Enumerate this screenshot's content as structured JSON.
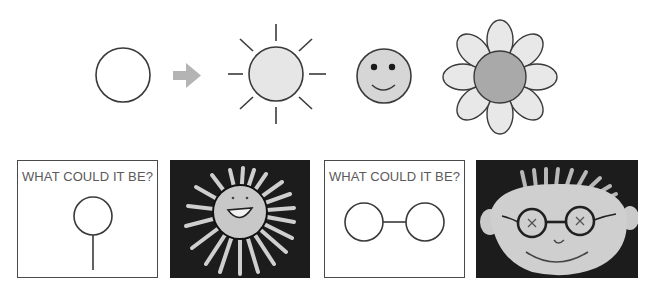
{
  "top_row": {
    "sequence": [
      {
        "id": "plain-circle",
        "label": "circle"
      },
      {
        "id": "arrow",
        "label": "arrow"
      },
      {
        "id": "sun",
        "label": "sun"
      },
      {
        "id": "smiley",
        "label": "smiley face"
      },
      {
        "id": "flower",
        "label": "flower"
      }
    ],
    "colors": {
      "stroke": "#3a3a3a",
      "arrow": "#b4b4b4",
      "sun_fill": "#e6e6e6",
      "smiley_fill": "#d6d6d6",
      "petal_fill": "#e8e8e8",
      "flower_center_fill": "#a9a9a9"
    }
  },
  "bottom_row": {
    "panels": [
      {
        "type": "prompt",
        "label": "WHAT COULD IT BE?",
        "shape": "circle-with-stem"
      },
      {
        "type": "photo",
        "subject": "child drawing of smiling sun"
      },
      {
        "type": "prompt",
        "label": "WHAT COULD IT BE?",
        "shape": "two-joined-circles"
      },
      {
        "type": "photo",
        "subject": "child drawing of face with glasses"
      }
    ]
  }
}
